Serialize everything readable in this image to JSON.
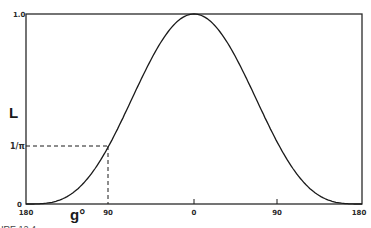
{
  "chart_data": {
    "type": "line",
    "title": "",
    "xlabel": "g°",
    "ylabel": "L",
    "x_ticks": [
      "180",
      "90",
      "0",
      "90",
      "180"
    ],
    "x_tick_values": [
      -180,
      -90,
      0,
      90,
      180
    ],
    "y_ticks": [
      "0",
      "1/π",
      "1.0"
    ],
    "y_tick_values": [
      0,
      0.318,
      1.0
    ],
    "xlim": [
      -180,
      180
    ],
    "ylim": [
      0,
      1.0
    ],
    "grid": false,
    "legend": null,
    "series": [
      {
        "name": "L(g)",
        "x": [
          -180,
          -150,
          -120,
          -90,
          -60,
          -30,
          0,
          30,
          60,
          90,
          120,
          150,
          180
        ],
        "values": [
          0.0,
          0.004,
          0.1,
          0.318,
          0.62,
          0.9,
          1.0,
          0.9,
          0.62,
          0.318,
          0.1,
          0.004,
          0.0
        ]
      }
    ],
    "annotations": [
      {
        "type": "dashed-guide",
        "x": -90,
        "y": 0.318,
        "label": "1/π"
      }
    ],
    "caption": "FIGURE 12.4"
  },
  "labels": {
    "y_top": "1.0",
    "y_mid": "1/π",
    "y_bottom": "0",
    "y_axis": "L",
    "x_axis": "g°",
    "x_ticks": [
      "180",
      "90",
      "0",
      "90",
      "180"
    ],
    "caption": "FIGURE 12.4"
  }
}
